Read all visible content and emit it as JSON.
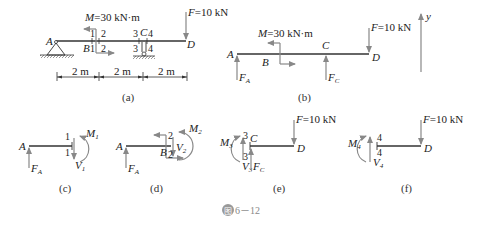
{
  "figure": {
    "caption": "图6－12",
    "caption_prefix": "图",
    "caption_number": "6－12"
  },
  "panels": {
    "a": {
      "label": "(a)",
      "moment_label": "M=30 kN·m",
      "force_label": "F=10 kN",
      "points": [
        "A",
        "B",
        "C",
        "D"
      ],
      "section_marks": [
        "1",
        "1",
        "2",
        "2",
        "3",
        "3",
        "4",
        "4"
      ],
      "dimensions": [
        "2 m",
        "2 m",
        "2 m"
      ]
    },
    "b": {
      "label": "(b)",
      "moment_label": "M=30 kN·m",
      "force_label": "F=10 kN",
      "points": [
        "A",
        "B",
        "C",
        "D"
      ],
      "reactions": [
        "F_A",
        "F_C"
      ],
      "axis": "y"
    },
    "c": {
      "label": "(c)",
      "points": [
        "A"
      ],
      "sections": [
        "1",
        "1"
      ],
      "forces": [
        "F_A",
        "V_1",
        "M_1"
      ]
    },
    "d": {
      "label": "(d)",
      "points": [
        "A",
        "B"
      ],
      "sections": [
        "2",
        "2"
      ],
      "forces": [
        "F_A",
        "V_2",
        "M_2"
      ]
    },
    "e": {
      "label": "(e)",
      "force_label": "F=10 kN",
      "points": [
        "C",
        "D"
      ],
      "sections": [
        "3",
        "3"
      ],
      "forces": [
        "M_3",
        "V_3",
        "F_C"
      ]
    },
    "f": {
      "label": "(f)",
      "force_label": "F=10 kN",
      "points": [
        "D"
      ],
      "sections": [
        "4",
        "4"
      ],
      "forces": [
        "M_4",
        "V_4"
      ]
    }
  }
}
